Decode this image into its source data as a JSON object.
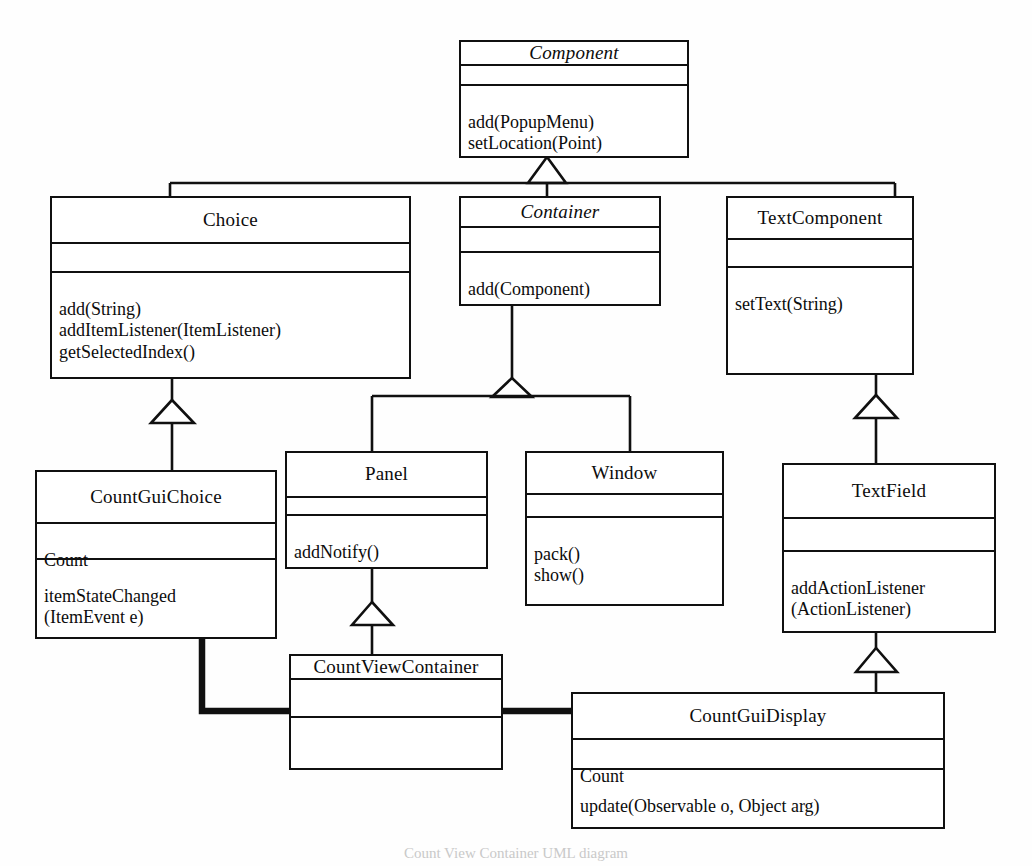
{
  "diagram": {
    "title": "Count View Container UML diagram",
    "stroke_color": "#101010",
    "background_color": "#fefefe",
    "caption": "Count View Container UML diagram",
    "classes": [
      {
        "id": "component",
        "name": "Component",
        "abstract": true,
        "attributes": "",
        "operations": "add(PopupMenu)\nsetLocation(Point)"
      },
      {
        "id": "choice",
        "name": "Choice",
        "abstract": false,
        "attributes": "",
        "operations": "add(String)\naddItemListener(ItemListener)\ngetSelectedIndex()"
      },
      {
        "id": "container",
        "name": "Container",
        "abstract": true,
        "attributes": "",
        "operations": "add(Component)"
      },
      {
        "id": "textcomponent",
        "name": "TextComponent",
        "abstract": false,
        "attributes": "",
        "operations": "setText(String)"
      },
      {
        "id": "countguichoice",
        "name": "CountGuiChoice",
        "abstract": false,
        "attributes": "Count",
        "operations": "itemStateChanged\n(ItemEvent e)"
      },
      {
        "id": "panel",
        "name": "Panel",
        "abstract": false,
        "attributes": "",
        "operations": "addNotify()"
      },
      {
        "id": "window",
        "name": "Window",
        "abstract": false,
        "attributes": "",
        "operations": "pack()\nshow()"
      },
      {
        "id": "textfield",
        "name": "TextField",
        "abstract": false,
        "attributes": "",
        "operations": "addActionListener\n(ActionListener)"
      },
      {
        "id": "countviewcontainer",
        "name": "CountViewContainer",
        "abstract": false,
        "attributes": "",
        "operations": ""
      },
      {
        "id": "countguidisplay",
        "name": "CountGuiDisplay",
        "abstract": false,
        "attributes": "Count",
        "operations": "update(Observable o, Object arg)"
      }
    ],
    "relationships": [
      {
        "type": "generalization",
        "from": "Choice",
        "to": "Component"
      },
      {
        "type": "generalization",
        "from": "Container",
        "to": "Component"
      },
      {
        "type": "generalization",
        "from": "TextComponent",
        "to": "Component"
      },
      {
        "type": "generalization",
        "from": "CountGuiChoice",
        "to": "Choice"
      },
      {
        "type": "generalization",
        "from": "Panel",
        "to": "Container"
      },
      {
        "type": "generalization",
        "from": "Window",
        "to": "Container"
      },
      {
        "type": "generalization",
        "from": "TextField",
        "to": "TextComponent"
      },
      {
        "type": "generalization",
        "from": "CountViewContainer",
        "to": "Panel"
      },
      {
        "type": "generalization",
        "from": "CountGuiDisplay",
        "to": "TextField"
      },
      {
        "type": "association",
        "from": "CountGuiChoice",
        "to": "CountViewContainer"
      },
      {
        "type": "association",
        "from": "CountViewContainer",
        "to": "CountGuiDisplay"
      }
    ]
  }
}
